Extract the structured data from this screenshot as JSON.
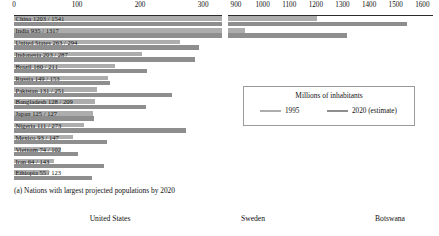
{
  "chart_data": {
    "type": "bar",
    "title": "",
    "caption": "(a) Nations with largest projected populations by 2020",
    "xlabel": "",
    "ylabel": "",
    "orientation": "horizontal",
    "grid": false,
    "broken_axis": true,
    "axis_segments": [
      {
        "name": "left",
        "min": 0,
        "max": 330,
        "ticks": [
          0,
          100,
          200,
          300
        ]
      },
      {
        "name": "right",
        "min": 870,
        "max": 1640,
        "ticks": [
          900,
          1000,
          1100,
          1200,
          1300,
          1400,
          1500,
          1600
        ]
      }
    ],
    "categories": [
      "China",
      "India",
      "United States",
      "Indonesia",
      "Brazil",
      "Russia",
      "Pakistan",
      "Bangladesh",
      "Japan",
      "Nigeria",
      "Mexico",
      "Vietnam",
      "Iran",
      "Ethiopia"
    ],
    "series": [
      {
        "name": "1995",
        "color": "#adadad",
        "values": [
          1203,
          935,
          263,
          203,
          160,
          149,
          131,
          128,
          125,
          111,
          93,
          74,
          64,
          55
        ]
      },
      {
        "name": "2020 (estimate)",
        "color": "#8e8e8e",
        "values": [
          1541,
          1317,
          294,
          287,
          211,
          153,
          251,
          209,
          127,
          273,
          147,
          102,
          143,
          123
        ]
      }
    ],
    "row_labels": [
      "China 1203 / 1541",
      "India 935 / 1317",
      "United States 263 / 294",
      "Indonesia 203 / 287",
      "Brazil 160 / 211",
      "Russia 149 / 153",
      "Pakistan 131 / 251",
      "Bangladesh 128 / 209",
      "Japan 125 / 127",
      "Nigeria 111 / 273",
      "Mexico 93 / 147",
      "Vietnam 74 / 102",
      "Iran 64 / 143",
      "Ethiopia 55 / 123"
    ],
    "legend": {
      "title": "Millions of inhabitants",
      "position": "center-right",
      "entries": [
        "1995",
        "2020 (estimate)"
      ]
    }
  },
  "next_figure": {
    "panels": [
      "United States",
      "Sweden",
      "Botswana"
    ]
  }
}
